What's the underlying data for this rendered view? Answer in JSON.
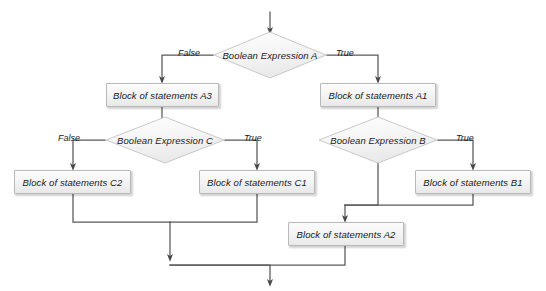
{
  "diagram": {
    "type": "flowchart",
    "title_fragment": "",
    "colors": {
      "line": "#595959",
      "box_border": "#b9b9b9",
      "box_fill_top": "#fcfcfc",
      "box_fill_bottom": "#e8e8e8",
      "diamond_border": "#c8c8c8",
      "diamond_fill": "#f2f2f2",
      "text": "#1a1a1a",
      "background": "#ffffff"
    },
    "decisions": [
      {
        "id": "A",
        "label": "Boolean Expression A"
      },
      {
        "id": "C",
        "label": "Boolean Expression C"
      },
      {
        "id": "B",
        "label": "Boolean Expression B"
      }
    ],
    "processes": [
      {
        "id": "A3",
        "label": "Block of statements A3"
      },
      {
        "id": "A1",
        "label": "Block of statements A1"
      },
      {
        "id": "C2",
        "label": "Block of statements C2"
      },
      {
        "id": "C1",
        "label": "Block of statements C1"
      },
      {
        "id": "B1",
        "label": "Block of statements B1"
      },
      {
        "id": "A2",
        "label": "Block of statements A2"
      }
    ],
    "edge_labels": {
      "a_false": "False",
      "a_true": "True",
      "c_false": "False",
      "c_true": "True",
      "b_true": "True"
    }
  }
}
